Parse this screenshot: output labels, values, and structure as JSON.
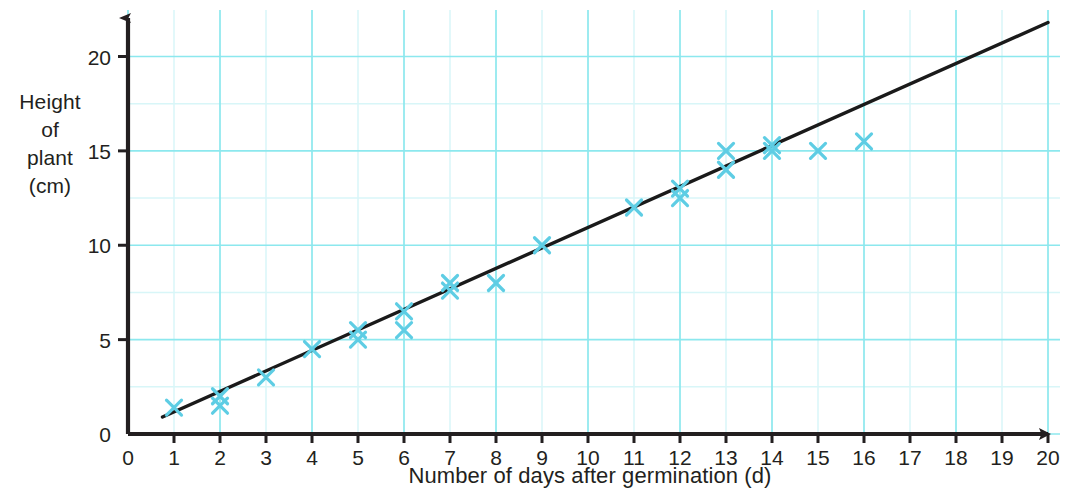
{
  "chart_data": {
    "type": "scatter",
    "title": "",
    "subtitle": "",
    "xlabel": "Number of days after germination (d)",
    "ylabel": "Height of plant (cm)",
    "ylabel_lines": [
      "Height",
      "of",
      "plant",
      "(cm)"
    ],
    "xlim": [
      0,
      20
    ],
    "ylim": [
      0,
      20
    ],
    "x_ticks": [
      0,
      1,
      2,
      3,
      4,
      5,
      6,
      7,
      8,
      9,
      10,
      11,
      12,
      13,
      14,
      15,
      16,
      17,
      18,
      19,
      20
    ],
    "x_tick_labels": [
      "0",
      "1",
      "2",
      "3",
      "4",
      "5",
      "6",
      "7",
      "8",
      "9",
      "10",
      "11",
      "12",
      "13",
      "14",
      "15",
      "16",
      "17",
      "18",
      "19",
      "20"
    ],
    "y_ticks": [
      0,
      5,
      10,
      15,
      20
    ],
    "y_tick_labels": [
      "0",
      "5",
      "10",
      "15",
      "20"
    ],
    "grid": true,
    "grid_major_x_step": 2,
    "grid_minor_x_step": 1,
    "grid_major_y_step": 5,
    "grid_minor_y_step": 2.5,
    "grid_major_color": "#8ce8ee",
    "grid_minor_color": "#d8f6f8",
    "axis_color": "#231f20",
    "marker_color": "#5ecde4",
    "marker_symbol": "x",
    "trendline_color": "#1a1a1a",
    "legend": null,
    "points": [
      {
        "x": 1,
        "y": 1.4
      },
      {
        "x": 2,
        "y": 2.0
      },
      {
        "x": 2,
        "y": 1.5
      },
      {
        "x": 3,
        "y": 3.0
      },
      {
        "x": 4,
        "y": 4.5
      },
      {
        "x": 5,
        "y": 5.5
      },
      {
        "x": 5,
        "y": 5.0
      },
      {
        "x": 6,
        "y": 6.5
      },
      {
        "x": 6,
        "y": 5.5
      },
      {
        "x": 7,
        "y": 8.0
      },
      {
        "x": 7,
        "y": 7.6
      },
      {
        "x": 8,
        "y": 8.0
      },
      {
        "x": 9,
        "y": 10.0
      },
      {
        "x": 11,
        "y": 12.0
      },
      {
        "x": 12,
        "y": 13.0
      },
      {
        "x": 12,
        "y": 12.5
      },
      {
        "x": 13,
        "y": 15.0
      },
      {
        "x": 13,
        "y": 14.0
      },
      {
        "x": 14,
        "y": 15.3
      },
      {
        "x": 14,
        "y": 15.0
      },
      {
        "x": 15,
        "y": 15.0
      },
      {
        "x": 16,
        "y": 15.5
      }
    ],
    "trendline": {
      "x0": 0.75,
      "y0": 0.9,
      "x1": 20.0,
      "y1": 21.8
    },
    "series": [
      {
        "name": "Height of plant",
        "x": [
          1,
          2,
          2,
          3,
          4,
          5,
          5,
          6,
          6,
          7,
          7,
          8,
          9,
          11,
          12,
          12,
          13,
          13,
          14,
          14,
          15,
          16
        ],
        "values": [
          1.4,
          2.0,
          1.5,
          3.0,
          4.5,
          5.5,
          5.0,
          6.5,
          5.5,
          8.0,
          7.6,
          8.0,
          10.0,
          12.0,
          13.0,
          12.5,
          15.0,
          14.0,
          15.3,
          15.0,
          15.0,
          15.5
        ]
      }
    ]
  }
}
